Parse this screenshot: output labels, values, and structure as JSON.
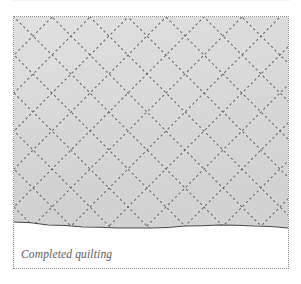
{
  "figure": {
    "caption": "Completed quilting",
    "frame_border_color": "#8c8c8c",
    "frame_border_style": "dotted",
    "background_color": "#ffffff"
  },
  "photo": {
    "subject": "quilted fabric",
    "fabric_color": "#dadada",
    "fabric_shadow_color": "#cfcfcf",
    "stitch_color": "#3a3a3a",
    "edge_line_color": "#4a4a4a",
    "quilting_pattern": "diagonal crosshatch diamond lattice",
    "stitch_style": "dashed running stitch",
    "diamond_pitch_px": 38,
    "stitch_angle_degrees": 45
  },
  "chart_data": {
    "type": "scatter",
    "title": "Completed quilting",
    "xlabel": "",
    "ylabel": "",
    "grid": true,
    "legend": false,
    "pitch": 38,
    "down_right_offsets": [
      -228,
      -190,
      -152,
      -114,
      -76,
      -38,
      0,
      38,
      76,
      114,
      152,
      190,
      228,
      266
    ],
    "down_left_offsets": [
      0,
      38,
      76,
      114,
      152,
      190,
      228,
      266,
      304,
      342,
      380,
      418,
      456,
      494
    ],
    "fabric_edge_points": [
      [
        0,
        205
      ],
      [
        34,
        208
      ],
      [
        69,
        210
      ],
      [
        103,
        211
      ],
      [
        137,
        211
      ],
      [
        171,
        209
      ],
      [
        206,
        208
      ],
      [
        240,
        209
      ],
      [
        274,
        211
      ]
    ]
  }
}
